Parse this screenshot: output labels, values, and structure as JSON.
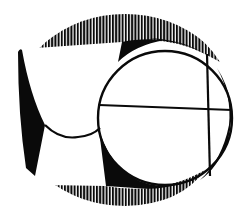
{
  "image": {
    "title": "Abstract emblem",
    "description": "Black and white abstract emblem: oval with hatched top and bottom bands, a circle divided by crossing lines, and a rounded shield-like white shape on the left",
    "colors": {
      "ink": "#0a0a0a",
      "paper": "#ffffff"
    }
  }
}
